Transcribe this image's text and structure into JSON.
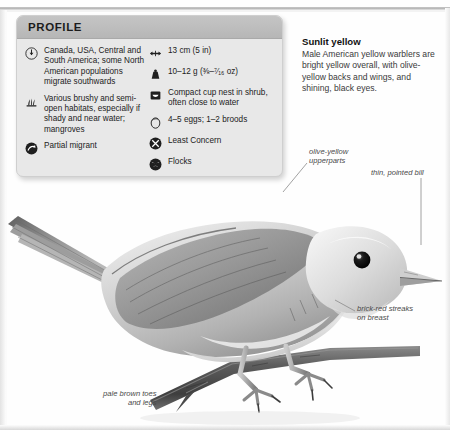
{
  "profile": {
    "header": "PROFILE",
    "left_entries": [
      {
        "icon": "range-globe-icon",
        "text": "Canada, USA, Central\nand South America;\nsome North American\npopulations migrate\nsouthwards"
      },
      {
        "icon": "habitat-grass-icon",
        "text": "Various brushy\nand semi-open\nhabitats, especially\nif shady and near\nwater; mangroves"
      },
      {
        "icon": "migration-arrow-icon",
        "text": "Partial migrant"
      }
    ],
    "right_entries": [
      {
        "icon": "length-arrows-icon",
        "text": "13 cm (5 in)"
      },
      {
        "icon": "weight-icon",
        "text": "10–12 g (⅜–⁷⁄₁₆ oz)"
      },
      {
        "icon": "nest-icon",
        "text": "Compact cup nest\nin shrub, often close\nto water"
      },
      {
        "icon": "egg-icon",
        "text": "4–5 eggs; 1–2 broods"
      },
      {
        "icon": "conservation-status-icon",
        "text": "Least Concern"
      },
      {
        "icon": "social-flocks-icon",
        "text": "Flocks"
      }
    ]
  },
  "description": {
    "heading": "Sunlit yellow",
    "body": "Male American yellow warblers are bright yellow overall, with olive-yellow backs and wings, and shining, black eyes."
  },
  "annotations": {
    "upperparts": "olive-yellow\nupperparts",
    "bill": "thin, pointed bill",
    "breast": "brick-red streaks\non breast",
    "toes": "pale brown toes\nand legs"
  },
  "colors": {
    "panel_bg": "#e8e8e8",
    "panel_header": "#bdbdbd",
    "text": "#222222",
    "annotation": "#4a4a4a",
    "leader_line": "#8a8a8a"
  }
}
